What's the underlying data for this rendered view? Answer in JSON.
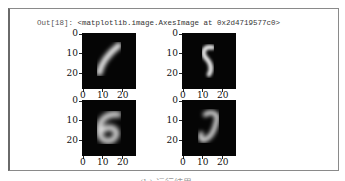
{
  "output": {
    "prompt": "Out[18]:",
    "repr": "<matplotlib.image.AxesImage at 0x2d4719577c0>"
  },
  "plots": [
    {
      "digit_shape": "1 (slanted stroke)",
      "yticks": [
        "0",
        "10",
        "20"
      ],
      "xticks": [
        "0",
        "10",
        "20"
      ]
    },
    {
      "digit_shape": "5",
      "yticks": [
        "0",
        "10",
        "20"
      ],
      "xticks": [
        "0",
        "10",
        "20"
      ]
    },
    {
      "digit_shape": "6",
      "yticks": [
        "0",
        "10",
        "20"
      ],
      "xticks": [
        "0",
        "10",
        "20"
      ]
    },
    {
      "digit_shape": "3 / J",
      "yticks": [
        "0",
        "10",
        "20"
      ],
      "xticks": [
        "0",
        "10",
        "20"
      ]
    }
  ],
  "caption": "(b) 运行结果",
  "colors": {
    "frame_border": "#8a8a8a",
    "image_bg": "#050505",
    "stroke": "#e8e8e8"
  }
}
